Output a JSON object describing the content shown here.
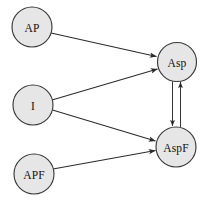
{
  "diagram": {
    "background_color": "#ffffff",
    "node_fill_color": "#e6e6e6",
    "node_stroke_color": "#3a3a3a",
    "edge_color": "#2b2b2b",
    "label_color": "#111111",
    "nodes": [
      {
        "id": "AP",
        "label": "AP",
        "cx": 32,
        "cy": 27,
        "r": 20
      },
      {
        "id": "I",
        "label": "I",
        "cx": 33,
        "cy": 105,
        "r": 20
      },
      {
        "id": "APF",
        "label": "APF",
        "cx": 34,
        "cy": 174,
        "r": 20
      },
      {
        "id": "Asp",
        "label": "Asp",
        "cx": 177,
        "cy": 62,
        "r": 19.5
      },
      {
        "id": "AspF",
        "label": "AspF",
        "cx": 176,
        "cy": 147,
        "r": 20
      }
    ],
    "edges": [
      {
        "from": "AP",
        "to": "Asp",
        "directed": true,
        "label": ""
      },
      {
        "from": "I",
        "to": "Asp",
        "directed": true,
        "label": ""
      },
      {
        "from": "I",
        "to": "AspF",
        "directed": true,
        "label": ""
      },
      {
        "from": "APF",
        "to": "AspF",
        "directed": true,
        "label": ""
      },
      {
        "from": "Asp",
        "to": "AspF",
        "directed": true,
        "label": ""
      },
      {
        "from": "AspF",
        "to": "Asp",
        "directed": true,
        "label": ""
      }
    ]
  }
}
